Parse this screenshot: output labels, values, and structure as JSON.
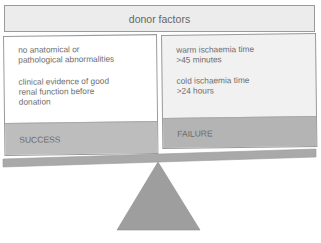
{
  "diagram": {
    "title": "donor factors",
    "left_panel": {
      "factors": [
        "no anatomical or\npathological abnormalities",
        "clinical evidence of good\nrenal function before\ndonation"
      ],
      "outcome_label": "SUCCESS"
    },
    "right_panel": {
      "factors": [
        "warm ischaemia time\n>45 minutes",
        "cold ischaemia time\n>24 hours"
      ],
      "outcome_label": "FAILURE"
    },
    "balance": {
      "beam_color": "#a9a9a9",
      "fulcrum_color": "#9e9e9e",
      "tilt": "left side lower"
    }
  }
}
